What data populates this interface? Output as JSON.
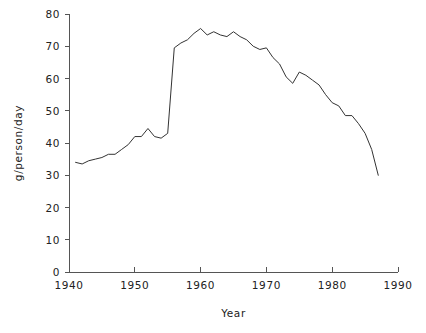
{
  "chart_data": {
    "type": "line",
    "title": "",
    "xlabel": "Year",
    "ylabel": "g/person/day",
    "xlim": [
      1940,
      1990
    ],
    "ylim": [
      0,
      80
    ],
    "grid": false,
    "legend": false,
    "x_ticks": [
      1940,
      1950,
      1960,
      1970,
      1980,
      1990
    ],
    "y_ticks": [
      0,
      10,
      20,
      30,
      40,
      50,
      60,
      70,
      80
    ],
    "x_tick_labels": [
      "1940",
      "1950",
      "1960",
      "1970",
      "1980",
      "1990"
    ],
    "y_tick_labels": [
      "0",
      "10",
      "20",
      "30",
      "40",
      "50",
      "60",
      "70",
      "80"
    ],
    "series": [
      {
        "name": "g/person/day",
        "color": "#333333",
        "x": [
          1941,
          1942,
          1943,
          1944,
          1945,
          1946,
          1947,
          1948,
          1949,
          1950,
          1951,
          1952,
          1953,
          1954,
          1955,
          1956,
          1957,
          1958,
          1959,
          1960,
          1961,
          1962,
          1963,
          1964,
          1965,
          1966,
          1967,
          1968,
          1969,
          1970,
          1971,
          1972,
          1973,
          1974,
          1975,
          1976,
          1977,
          1978,
          1979,
          1980,
          1981,
          1982,
          1983,
          1984,
          1985,
          1986,
          1987
        ],
        "values": [
          34.0,
          33.5,
          34.5,
          35.0,
          35.5,
          36.5,
          36.5,
          38.0,
          39.5,
          42.0,
          42.0,
          44.5,
          42.0,
          41.5,
          43.0,
          69.5,
          71.0,
          72.0,
          74.0,
          75.5,
          73.5,
          74.5,
          73.5,
          73.0,
          74.5,
          73.0,
          72.0,
          70.0,
          69.0,
          69.5,
          66.5,
          64.5,
          60.5,
          58.5,
          62.0,
          61.0,
          59.5,
          58.0,
          55.0,
          52.5,
          51.5,
          48.5,
          48.5,
          46.0,
          43.0,
          38.0,
          30.0
        ]
      }
    ]
  },
  "axes": {
    "x_axis_title": "Year",
    "y_axis_title": "g/person/day"
  }
}
